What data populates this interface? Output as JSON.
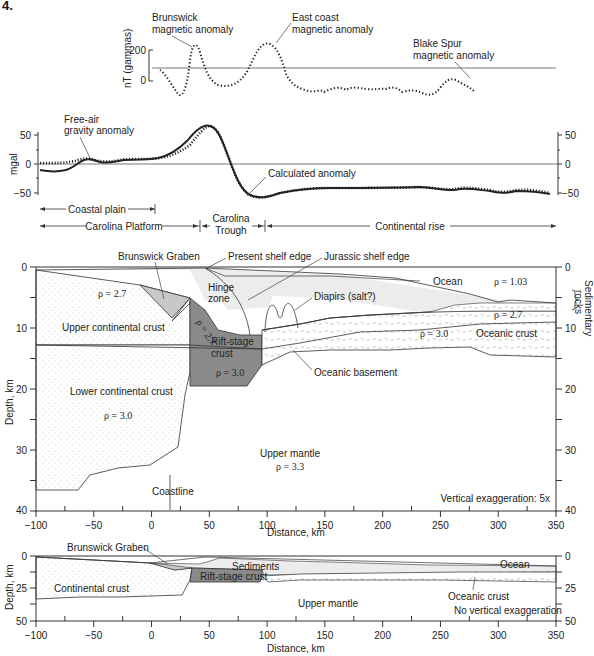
{
  "figure_number": "4.",
  "magnetic_panel": {
    "axis_label": "nT (gammas)",
    "ticks": [
      "200",
      "0"
    ],
    "labels": {
      "brunswick": [
        "Brunswick",
        "magnetic anomaly"
      ],
      "east_coast": [
        "East coast",
        "magnetic anomaly"
      ],
      "blake_spur": [
        "Blake Spur",
        "magnetic anomaly"
      ]
    }
  },
  "gravity_panel": {
    "axis_label": "mgal",
    "left_ticks": [
      "50",
      "0",
      "−50"
    ],
    "right_ticks": [
      "50",
      "0",
      "−50"
    ],
    "labels": {
      "free_air": [
        "Free-air",
        "gravity anomaly"
      ],
      "calculated": "Calculated anomaly"
    }
  },
  "provinces": {
    "coastal_plain": "Coastal plain",
    "carolina_platform": "Carolina Platform",
    "carolina_trough": [
      "Carolina",
      "Trough"
    ],
    "continental_rise": "Continental rise"
  },
  "cross_section": {
    "y_axis_label": "Depth, km",
    "x_axis_label": "Distance, km",
    "right_axis_label": [
      "Sedimentary",
      "rocks"
    ],
    "y_ticks": [
      "0",
      "10",
      "20",
      "30",
      "40"
    ],
    "x_ticks": [
      "−100",
      "−50",
      "0",
      "50",
      "100",
      "150",
      "200",
      "250",
      "300",
      "350"
    ],
    "labels": {
      "brunswick_graben": "Brunswick Graben",
      "present_shelf_edge": "Present shelf edge",
      "jurassic_shelf_edge": "Jurassic shelf edge",
      "ocean": "Ocean",
      "ocean_density": "ρ = 1.03",
      "hinge_zone": [
        "Hinge",
        "zone"
      ],
      "diapirs": "Diapirs (salt?)",
      "upper_crust_density": "ρ = 2.7",
      "upper_continental_crust": "Upper continental crust",
      "rift_density_upper": "ρ = 2.7",
      "rift_stage_crust": [
        "Rift-stage",
        "crust"
      ],
      "rift_density_lower": "ρ = 3.0",
      "sed_density": "ρ = 2.7",
      "oceanic_density": "ρ = 3.0",
      "oceanic_crust": "Oceanic crust",
      "oceanic_basement": "Oceanic basement",
      "lower_continental_crust": "Lower continental crust",
      "lower_crust_density": "ρ = 3.0",
      "upper_mantle": "Upper mantle",
      "mantle_density": "ρ = 3.3",
      "coastline": "Coastline",
      "vertical_exaggeration": "Vertical exaggeration: 5x"
    }
  },
  "true_scale_section": {
    "y_axis_label": "Depth, km",
    "x_axis_label": "Distance, km",
    "y_ticks": [
      "0",
      "25",
      "50"
    ],
    "x_ticks": [
      "−100",
      "−50",
      "0",
      "50",
      "100",
      "150",
      "200",
      "250",
      "300",
      "350"
    ],
    "labels": {
      "brunswick_graben": "Brunswick Graben",
      "sediments": "Sediments",
      "ocean": "Ocean",
      "continental_crust": "Continental crust",
      "rift_stage_crust": "Rift-stage crust",
      "upper_mantle": "Upper mantle",
      "oceanic_crust": "Oceanic crust",
      "no_exaggeration": "No vertical exaggeration"
    }
  },
  "colors": {
    "line": "#333333",
    "light_fill": "#e9e9e9",
    "graben_fill": "#c8c8c8",
    "rift_fill": "#8a8a8a",
    "white": "#ffffff"
  }
}
